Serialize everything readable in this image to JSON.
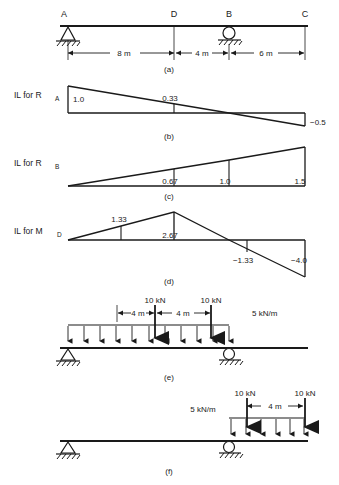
{
  "figure": {
    "stroke_color": "#1a1a1a",
    "background_color": "#ffffff"
  },
  "panels": [
    {
      "id": "a",
      "caption": "(a)",
      "type": "beam-geometry",
      "nodes": [
        {
          "label": "A",
          "x_m": 0,
          "support": "pin"
        },
        {
          "label": "D",
          "x_m": 8,
          "support": "none"
        },
        {
          "label": "B",
          "x_m": 12,
          "support": "roller"
        },
        {
          "label": "C",
          "x_m": 18,
          "support": "free-end"
        }
      ],
      "dimensions": [
        {
          "label": "8 m",
          "from": "A",
          "to": "D"
        },
        {
          "label": "4 m",
          "from": "D",
          "to": "B"
        },
        {
          "label": "6 m",
          "from": "B",
          "to": "C"
        }
      ]
    },
    {
      "id": "b",
      "caption": "(b)",
      "type": "influence-line",
      "label": "IL for R",
      "label_sub": "A",
      "ordinates": [
        {
          "at": "A",
          "x_m": 0,
          "value": 1.0,
          "text": "1.0"
        },
        {
          "at": "D",
          "x_m": 8,
          "value": 0.33,
          "text": "0.33"
        },
        {
          "at": "B",
          "x_m": 12,
          "value": 0.0,
          "text": ""
        },
        {
          "at": "C",
          "x_m": 18,
          "value": -0.5,
          "text": "−0.5"
        }
      ]
    },
    {
      "id": "c",
      "caption": "(c)",
      "type": "influence-line",
      "label": "IL for R",
      "label_sub": "B",
      "ordinates": [
        {
          "at": "A",
          "x_m": 0,
          "value": 0.0,
          "text": ""
        },
        {
          "at": "D",
          "x_m": 8,
          "value": 0.67,
          "text": "0.67"
        },
        {
          "at": "B",
          "x_m": 12,
          "value": 1.0,
          "text": "1.0"
        },
        {
          "at": "C",
          "x_m": 18,
          "value": 1.5,
          "text": "1.5"
        }
      ]
    },
    {
      "id": "d",
      "caption": "(d)",
      "type": "influence-line",
      "label": "IL for M",
      "label_sub": "D",
      "ordinates": [
        {
          "at": "A",
          "x_m": 0,
          "value": 0.0,
          "text": ""
        },
        {
          "at": "4m",
          "x_m": 4,
          "value": 1.33,
          "text": "1.33"
        },
        {
          "at": "D",
          "x_m": 8,
          "value": 2.67,
          "text": "2.67"
        },
        {
          "at": "B",
          "x_m": 12,
          "value": 0.0,
          "text": ""
        },
        {
          "at": "14m",
          "x_m": 14,
          "value": -1.33,
          "text": "−1.33"
        },
        {
          "at": "C",
          "x_m": 18,
          "value": -4.0,
          "text": "−4.0"
        }
      ]
    },
    {
      "id": "e",
      "caption": "(e)",
      "type": "loading-case",
      "distributed_load": {
        "text": "5 kN/m",
        "from_m": 0,
        "to_m": 12
      },
      "point_loads": [
        {
          "text": "10 kN",
          "x_m": 4
        },
        {
          "text": "10 kN",
          "x_m": 8
        }
      ],
      "dimensions": [
        {
          "label": "4 m",
          "from_m": 0,
          "to_m": 4
        },
        {
          "label": "4 m",
          "from_m": 4,
          "to_m": 8
        }
      ],
      "supports": [
        {
          "type": "pin",
          "x_m": 0
        },
        {
          "type": "roller",
          "x_m": 12
        }
      ]
    },
    {
      "id": "f",
      "caption": "(f)",
      "type": "loading-case",
      "distributed_load": {
        "text": "5 kN/m",
        "from_m": 12,
        "to_m": 18
      },
      "point_loads": [
        {
          "text": "10 kN",
          "x_m": 12
        },
        {
          "text": "10 kN",
          "x_m": 18
        }
      ],
      "dimensions": [
        {
          "label": "4 m",
          "from_m": 12,
          "to_m": 18
        }
      ],
      "supports": [
        {
          "type": "pin",
          "x_m": 0
        },
        {
          "type": "roller",
          "x_m": 12
        }
      ]
    }
  ]
}
